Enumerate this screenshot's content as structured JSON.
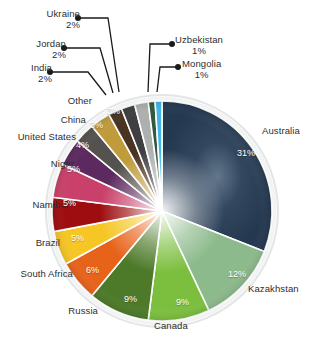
{
  "chart_data": {
    "type": "pie",
    "title": "",
    "subtitle": "",
    "xlabel": "",
    "ylabel": "",
    "legend_position": "none",
    "grid": false,
    "labels_outside": true,
    "total_percent": 100,
    "categories": [
      "Australia",
      "Kazakhstan",
      "Canada",
      "Russia",
      "South Africa",
      "Brazil",
      "Namibia",
      "Niger",
      "United States",
      "China",
      "Other",
      "India",
      "Jordan",
      "Ukraine",
      "Uzbekistan",
      "Mongolia"
    ],
    "values": [
      31,
      12,
      9,
      9,
      6,
      5,
      5,
      5,
      4,
      3,
      3,
      2,
      2,
      2,
      1,
      1
    ],
    "value_labels": [
      "31%",
      "12%",
      "9%",
      "9%",
      "6%",
      "5%",
      "5%",
      "5%",
      "4%",
      "3%",
      "3%",
      "2%",
      "2%",
      "2%",
      "1%",
      "1%"
    ],
    "colors": [
      "#2b4057",
      "#8dba8c",
      "#7cbf3f",
      "#4d7a29",
      "#e8631a",
      "#f5c624",
      "#9e0e10",
      "#c9406a",
      "#5d2a5f",
      "#55514e",
      "#bf9b3c",
      "#4a3320",
      "#3f3f41",
      "#adb0ae",
      "#2f5a3d",
      "#3fb5e8"
    ],
    "slices": [
      {
        "label": "Australia",
        "percent": 31,
        "percent_label": "31%",
        "color": "#2b4057",
        "label_placement": "outside-right",
        "pct_placement": "inside"
      },
      {
        "label": "Kazakhstan",
        "percent": 12,
        "percent_label": "12%",
        "color": "#8dba8c",
        "label_placement": "outside-right",
        "pct_placement": "inside"
      },
      {
        "label": "Canada",
        "percent": 9,
        "percent_label": "9%",
        "color": "#7cbf3f",
        "label_placement": "outside-bottom",
        "pct_placement": "inside"
      },
      {
        "label": "Russia",
        "percent": 9,
        "percent_label": "9%",
        "color": "#4d7a29",
        "label_placement": "outside-bottom",
        "pct_placement": "inside"
      },
      {
        "label": "South Africa",
        "percent": 6,
        "percent_label": "6%",
        "color": "#e8631a",
        "label_placement": "outside-left",
        "pct_placement": "inside"
      },
      {
        "label": "Brazil",
        "percent": 5,
        "percent_label": "5%",
        "color": "#f5c624",
        "label_placement": "outside-left",
        "pct_placement": "inside"
      },
      {
        "label": "Namibia",
        "percent": 5,
        "percent_label": "5%",
        "color": "#9e0e10",
        "label_placement": "outside-left",
        "pct_placement": "inside"
      },
      {
        "label": "Niger",
        "percent": 5,
        "percent_label": "5%",
        "color": "#c9406a",
        "label_placement": "outside-left",
        "pct_placement": "inside"
      },
      {
        "label": "United States",
        "percent": 4,
        "percent_label": "4%",
        "color": "#5d2a5f",
        "label_placement": "outside-left",
        "pct_placement": "inside"
      },
      {
        "label": "China",
        "percent": 3,
        "percent_label": "3%",
        "color": "#55514e",
        "label_placement": "outside-left",
        "pct_placement": "inside"
      },
      {
        "label": "Other",
        "percent": 3,
        "percent_label": "3%",
        "color": "#bf9b3c",
        "label_placement": "outside-left",
        "pct_placement": "inside"
      },
      {
        "label": "India",
        "percent": 2,
        "percent_label": "2%",
        "color": "#4a3320",
        "label_placement": "leader-left",
        "pct_placement": "outside"
      },
      {
        "label": "Jordan",
        "percent": 2,
        "percent_label": "2%",
        "color": "#3f3f41",
        "label_placement": "leader-left",
        "pct_placement": "outside"
      },
      {
        "label": "Ukraine",
        "percent": 2,
        "percent_label": "2%",
        "color": "#adb0ae",
        "label_placement": "leader-left",
        "pct_placement": "outside"
      },
      {
        "label": "Uzbekistan",
        "percent": 1,
        "percent_label": "1%",
        "color": "#2f5a3d",
        "label_placement": "leader-right",
        "pct_placement": "outside"
      },
      {
        "label": "Mongolia",
        "percent": 1,
        "percent_label": "1%",
        "color": "#3fb5e8",
        "label_placement": "leader-right",
        "pct_placement": "outside"
      }
    ]
  },
  "accent_color": "#2b4057",
  "background_color": "#ffffff",
  "text_color": "#2e2e2e"
}
